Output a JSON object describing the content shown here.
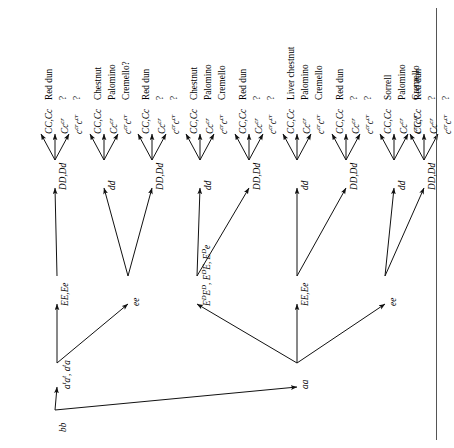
{
  "figure": {
    "type": "genetics-inheritance-tree",
    "orientation": "rotated-90-ccw",
    "root": {
      "label": "bb"
    }
  },
  "nodes": {
    "root": "bb",
    "agouti": [
      {
        "id": "at",
        "label": "aᵗaᵗ, aᵗa"
      },
      {
        "id": "aa",
        "label": "aa"
      }
    ],
    "extension": [
      {
        "id": "E1",
        "label": "EE,Ee"
      },
      {
        "id": "e1",
        "label": "ee"
      },
      {
        "id": "ED",
        "label": "EᴰEᴰ, EᴰE, Eᴰe"
      },
      {
        "id": "E2",
        "label": "EE,Ee"
      },
      {
        "id": "e2",
        "label": "ee"
      }
    ],
    "dun": [
      {
        "id": "D1",
        "label": "DD,Dd"
      },
      {
        "id": "d1",
        "label": "dd"
      },
      {
        "id": "D2",
        "label": "DD,Dd"
      },
      {
        "id": "d2",
        "label": "dd"
      },
      {
        "id": "D3",
        "label": "DD,Dd"
      },
      {
        "id": "d3",
        "label": "dd"
      },
      {
        "id": "D4",
        "label": "DD,Dd"
      },
      {
        "id": "d4",
        "label": "dd"
      },
      {
        "id": "D5",
        "label": "DD,Dd"
      }
    ]
  },
  "cream_alleles": [
    "CC,Cc",
    "Ccᶜʳ",
    "cᶜʳcᶜʳ"
  ],
  "groups": [
    {
      "parent": "D1",
      "genotypes": [
        "CC,Cc",
        "Cccr",
        "crcr"
      ],
      "phenotypes": [
        "Red dun",
        "?",
        "?"
      ]
    },
    {
      "parent": "d1",
      "genotypes": [
        "CC,Cc",
        "Cccr",
        "crcr"
      ],
      "phenotypes": [
        "Chestnut",
        "Palomino",
        "Cremello?"
      ]
    },
    {
      "parent": "D2",
      "genotypes": [
        "CC,Cc",
        "Cccr",
        "crcr"
      ],
      "phenotypes": [
        "Red dun",
        "?",
        "?"
      ]
    },
    {
      "parent": "d2",
      "genotypes": [
        "CC,Cc",
        "Cccr",
        "crcr"
      ],
      "phenotypes": [
        "Chestnut",
        "Palomino",
        "Cremello"
      ]
    },
    {
      "parent": "D3",
      "genotypes": [
        "CC,Cc",
        "Cccr",
        "crcr"
      ],
      "phenotypes": [
        "Red dun",
        "?",
        "?"
      ]
    },
    {
      "parent": "d3",
      "genotypes": [
        "CC,Cc",
        "Cccr",
        "crcr"
      ],
      "phenotypes": [
        "Liver chestnut",
        "Palomino",
        "Cremello"
      ]
    },
    {
      "parent": "D4",
      "genotypes": [
        "CC,Cc",
        "Cccr",
        "crcr"
      ],
      "phenotypes": [
        "Red dun",
        "?",
        "?"
      ]
    },
    {
      "parent": "d4",
      "genotypes": [
        "CC,Cc",
        "Cccr",
        "crcr"
      ],
      "phenotypes": [
        "Sorrell",
        "Palomino",
        "Cremello"
      ]
    },
    {
      "parent": "D5",
      "genotypes": [
        "CC,Cc",
        "Cccr",
        "crcr"
      ],
      "phenotypes": [
        "Red dun",
        "?",
        "?"
      ]
    }
  ],
  "leaf_genotype_labels": [
    "CC,Cc",
    "Ccᶜʳ",
    "cᶜʳcᶜʳ",
    "CC,Cc",
    "Ccᶜʳ",
    "cᶜʳcᶜʳ",
    "CC,Cc",
    "Ccᶜʳ",
    "cᶜʳcᶜʳ",
    "CC,Cc",
    "Ccᶜʳ",
    "cᶜʳcᶜʳ",
    "CC,Cc",
    "Ccᶜʳ",
    "cᶜʳcᶜʳ",
    "CC,Cc",
    "Ccᶜʳ",
    "cᶜʳcᶜʳ",
    "CC,Cc",
    "Ccᶜʳ",
    "cᶜʳcᶜʳ",
    "CC,Cc",
    "Ccᶜʳ",
    "cᶜʳcᶜʳ",
    "CC,Cc",
    "Ccᶜʳ",
    "cᶜʳcᶜʳ"
  ],
  "leaf_phenotype_labels": [
    "Red dun",
    "?",
    "?",
    "Chestnut",
    "Palomino",
    "Cremello?",
    "Red dun",
    "?",
    "?",
    "Chestnut",
    "Palomino",
    "Cremello",
    "Red dun",
    "?",
    "?",
    "Liver chestnut",
    "Palomino",
    "Cremello",
    "Red dun",
    "?",
    "?",
    "Sorrell",
    "Palomino",
    "Cremello",
    "Red dun",
    "?",
    "?"
  ]
}
